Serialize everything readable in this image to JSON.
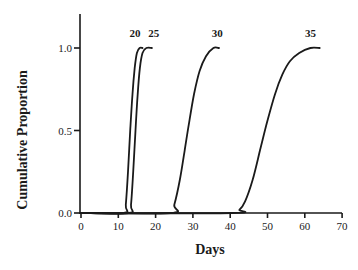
{
  "chart_data": {
    "type": "line",
    "title": "",
    "xlabel": "Days",
    "ylabel": "Cumulative Proportion",
    "xlim": [
      0,
      70
    ],
    "ylim": [
      0,
      1.2
    ],
    "xticks": [
      0,
      10,
      20,
      30,
      40,
      50,
      60,
      70
    ],
    "xtick_labels": [
      "0",
      "10",
      "20",
      "30",
      "40",
      "50",
      "60",
      "70"
    ],
    "yticks": [
      0.0,
      0.5,
      1.0
    ],
    "ytick_labels": [
      "0.0",
      "0.5",
      "1.0"
    ],
    "grid": false,
    "legend": "inline labels at curve tops",
    "series": [
      {
        "name": "20",
        "label_pos": [
          14.5,
          1.09
        ],
        "x": [
          0,
          11.5,
          12.0,
          12.6,
          13.2,
          13.8,
          14.4,
          15.0,
          15.7,
          16.5
        ],
        "y": [
          0,
          0.0,
          0.05,
          0.25,
          0.5,
          0.72,
          0.88,
          0.97,
          1.0,
          1.0
        ]
      },
      {
        "name": "25",
        "label_pos": [
          19.5,
          1.09
        ],
        "x": [
          0,
          12.8,
          13.4,
          14.0,
          14.6,
          15.2,
          15.8,
          16.5,
          17.5,
          19.0
        ],
        "y": [
          0,
          0.0,
          0.05,
          0.25,
          0.5,
          0.72,
          0.88,
          0.97,
          1.0,
          1.0
        ]
      },
      {
        "name": "30",
        "label_pos": [
          36.5,
          1.09
        ],
        "x": [
          0,
          24.0,
          25.0,
          26.5,
          27.8,
          29.0,
          30.3,
          31.8,
          33.5,
          35.5,
          37.0
        ],
        "y": [
          0,
          0.0,
          0.05,
          0.2,
          0.38,
          0.55,
          0.72,
          0.86,
          0.95,
          1.0,
          1.0
        ]
      },
      {
        "name": "35",
        "label_pos": [
          61.5,
          1.09
        ],
        "x": [
          0,
          40.5,
          42.5,
          44.0,
          46.0,
          48.0,
          50.0,
          52.0,
          54.0,
          56.0,
          58.5,
          61.5,
          64.0
        ],
        "y": [
          0,
          0.0,
          0.02,
          0.07,
          0.2,
          0.38,
          0.56,
          0.72,
          0.84,
          0.92,
          0.97,
          1.0,
          1.0
        ]
      }
    ]
  }
}
